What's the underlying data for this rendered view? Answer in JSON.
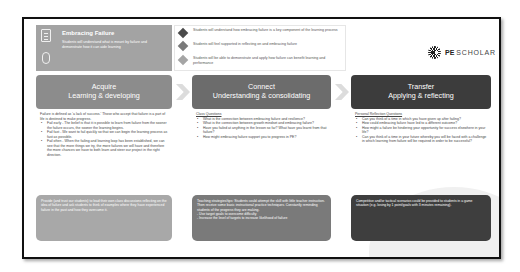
{
  "header": {
    "title": "Embracing Failure",
    "description": "Students will understand what is meant by failure and demonstrate how it can aide learning",
    "icons": [
      "clipboard-icon",
      "mouse-icon"
    ]
  },
  "objectives": [
    {
      "text": "Students will understand how embracing failure is a key component of the learning process",
      "color": "#4a4a4a"
    },
    {
      "text": "Students will feel supported in reflecting on and embracing failure",
      "color": "#7a7a7a"
    },
    {
      "text": "Students will be able to demonstrate and apply how failure can benefit learning and performance",
      "color": "#a5a5a5"
    }
  ],
  "brand": {
    "prefix": "PE",
    "name": "SCHOLAR"
  },
  "columns": [
    {
      "title": "Acquire",
      "subtitle": "Learning & developing",
      "intro": "Failure is defined as 'a lack of success.' Those who accept that failure is a part of life is destined to make progress.",
      "bullets": [
        "Fail early - The belief is that it is possible to learn from failure from the sooner the failure occurs, the sooner the learning begins.",
        "Fail fast - We want to fail quickly so that we can begin the learning process as fast as possible.",
        "Fail often - When the failing and learning loop has been established, we can see that the more things we try, the more failures we will have and therefore the more chances we have to both learn and steer our project in the right direction."
      ],
      "footer": "Provide (and trust our students) to lead their own class discussions reflecting on the idea of failure and ask students to think of examples where they have experienced failure in the past and how they overcame it."
    },
    {
      "title": "Connect",
      "subtitle": "Understanding & consolidating",
      "subheading": "Class Questions",
      "bullets": [
        "What is the connection between embracing failure and resilience?",
        "What is the connection between growth mindset and embracing failure?",
        "Have you failed at anything in the lesson so far? What have you learnt from that failure?",
        "How might embracing failure support you to progress in PE?"
      ],
      "footer": "Teaching strategies/tips: Students could attempt the skill with little teacher instruction. Then receive some basic instructional practice techniques. Constantly reminding students of the progress they are making.\n- Use target goals to overcome difficulty\n- Increase the level of targets to increase likelihood of failure"
    },
    {
      "title": "Transfer",
      "subtitle": "Applying & reflecting",
      "subheading": "Personal Reflection Questions",
      "bullets": [
        "Can you think of a time in which you have given up after failing?",
        "How could embracing failure have led to a different outcome?",
        "How might a failure be hindering your opportunity for success elsewhere in your life?",
        "Can you think of a time in your future whereby you will be faced with a challenge in which learning from failure will be required in order to be successful?"
      ],
      "footer": "Competitive and/or tactical scenarios could be provided to students in a game situation (e.g. losing by 1 point/goals with 3 minutes remaining)."
    }
  ]
}
